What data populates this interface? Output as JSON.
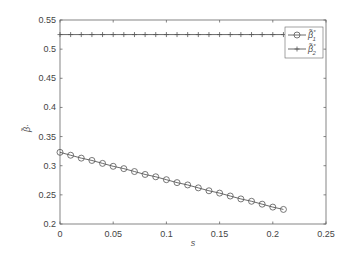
{
  "chart_data": {
    "type": "line",
    "title": "",
    "xlabel": "s",
    "ylabel": "β̃·",
    "xlim": [
      0,
      0.25
    ],
    "ylim": [
      0.2,
      0.55
    ],
    "xticks": [
      "0",
      "0.05",
      "0.1",
      "0.15",
      "0.2",
      "0.25"
    ],
    "yticks": [
      "0.2",
      "0.25",
      "0.3",
      "0.35",
      "0.4",
      "0.45",
      "0.5",
      "0.55"
    ],
    "grid": false,
    "legend_position": "upper right",
    "x": [
      0,
      0.01,
      0.02,
      0.03,
      0.04,
      0.05,
      0.06,
      0.07,
      0.08,
      0.09,
      0.1,
      0.11,
      0.12,
      0.13,
      0.14,
      0.15,
      0.16,
      0.17,
      0.18,
      0.19,
      0.2,
      0.21
    ],
    "series": [
      {
        "name": "β̃*1",
        "marker": "circle",
        "values": [
          0.323,
          0.318,
          0.313,
          0.309,
          0.304,
          0.299,
          0.295,
          0.29,
          0.285,
          0.281,
          0.276,
          0.271,
          0.267,
          0.262,
          0.257,
          0.253,
          0.248,
          0.243,
          0.239,
          0.234,
          0.229,
          0.225
        ]
      },
      {
        "name": "β̃*2",
        "marker": "plus",
        "values": [
          0.525,
          0.525,
          0.525,
          0.525,
          0.525,
          0.525,
          0.525,
          0.525,
          0.525,
          0.525,
          0.525,
          0.525,
          0.525,
          0.525,
          0.525,
          0.525,
          0.525,
          0.525,
          0.525,
          0.525,
          0.525,
          0.525
        ]
      }
    ]
  },
  "legend": {
    "items": [
      {
        "label": "β̃",
        "sup": "*",
        "sub": "1"
      },
      {
        "label": "β̃",
        "sup": "*",
        "sub": "2"
      }
    ]
  },
  "axes": {
    "xlabel": "s",
    "ylabel": "β̃·"
  }
}
